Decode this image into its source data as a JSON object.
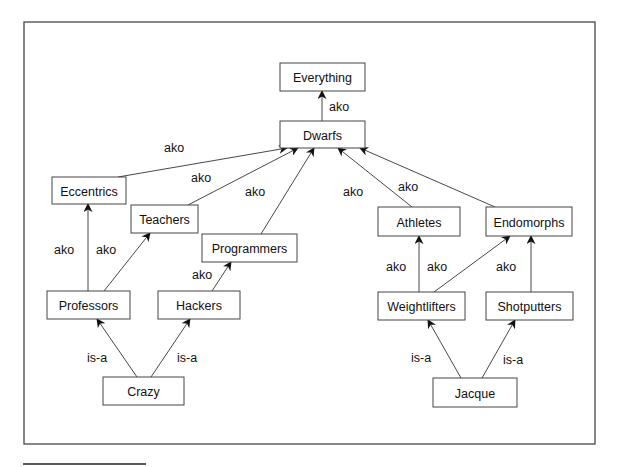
{
  "figure": {
    "frame": {
      "x": 24,
      "y": 22,
      "w": 571,
      "h": 422
    },
    "footnote_rule": {
      "x1": 23,
      "x2": 146,
      "y": 464
    },
    "nodes": [
      {
        "id": "everything",
        "label": "Everything",
        "x": 280,
        "y": 63,
        "w": 85,
        "h": 28
      },
      {
        "id": "dwarfs",
        "label": "Dwarfs",
        "x": 280,
        "y": 121,
        "w": 85,
        "h": 27
      },
      {
        "id": "eccentrics",
        "label": "Eccentrics",
        "x": 52,
        "y": 177,
        "w": 74,
        "h": 27
      },
      {
        "id": "teachers",
        "label": "Teachers",
        "x": 131,
        "y": 205,
        "w": 67,
        "h": 28
      },
      {
        "id": "programmers",
        "label": "Programmers",
        "x": 202,
        "y": 234,
        "w": 95,
        "h": 28
      },
      {
        "id": "athletes",
        "label": "Athletes",
        "x": 378,
        "y": 207,
        "w": 82,
        "h": 29
      },
      {
        "id": "endomorphs",
        "label": "Endomorphs",
        "x": 486,
        "y": 207,
        "w": 86,
        "h": 29
      },
      {
        "id": "professors",
        "label": "Professors",
        "x": 47,
        "y": 291,
        "w": 83,
        "h": 28
      },
      {
        "id": "hackers",
        "label": "Hackers",
        "x": 158,
        "y": 291,
        "w": 82,
        "h": 28
      },
      {
        "id": "weightlifters",
        "label": "Weightlifters",
        "x": 378,
        "y": 292,
        "w": 87,
        "h": 28
      },
      {
        "id": "shotputters",
        "label": "Shotputters",
        "x": 486,
        "y": 292,
        "w": 87,
        "h": 28
      },
      {
        "id": "crazy",
        "label": "Crazy",
        "x": 103,
        "y": 377,
        "w": 81,
        "h": 28
      },
      {
        "id": "jacque",
        "label": "Jacque",
        "x": 433,
        "y": 378,
        "w": 84,
        "h": 29
      }
    ],
    "edges": [
      {
        "from": "dwarfs",
        "to": "everything",
        "label": "ako",
        "x1": 322,
        "y1": 121,
        "x2": 322,
        "y2": 91,
        "lx": 329,
        "ly": 111
      },
      {
        "from": "eccentrics",
        "to": "dwarfs",
        "label": "ako",
        "x1": 118,
        "y1": 177,
        "x2": 287,
        "y2": 148,
        "lx": 164,
        "ly": 152
      },
      {
        "from": "teachers",
        "to": "dwarfs",
        "label": "ako",
        "x1": 188,
        "y1": 205,
        "x2": 298,
        "y2": 148,
        "lx": 191,
        "ly": 182
      },
      {
        "from": "programmers",
        "to": "dwarfs",
        "label": "ako",
        "x1": 261,
        "y1": 234,
        "x2": 314,
        "y2": 148,
        "lx": 245,
        "ly": 196
      },
      {
        "from": "athletes",
        "to": "dwarfs",
        "label": "ako",
        "x1": 412,
        "y1": 207,
        "x2": 338,
        "y2": 148,
        "lx": 343,
        "ly": 196
      },
      {
        "from": "endomorphs",
        "to": "dwarfs",
        "label": "ako",
        "x1": 495,
        "y1": 207,
        "x2": 360,
        "y2": 148,
        "lx": 398,
        "ly": 191
      },
      {
        "from": "professors",
        "to": "eccentrics",
        "label": "ako",
        "x1": 88,
        "y1": 291,
        "x2": 88,
        "y2": 204,
        "lx": 54,
        "ly": 254
      },
      {
        "from": "professors",
        "to": "teachers",
        "label": "ako",
        "x1": 104,
        "y1": 291,
        "x2": 150,
        "y2": 233,
        "lx": 96,
        "ly": 254
      },
      {
        "from": "hackers",
        "to": "programmers",
        "label": "ako",
        "x1": 212,
        "y1": 291,
        "x2": 231,
        "y2": 262,
        "lx": 192,
        "ly": 279
      },
      {
        "from": "weightlifters",
        "to": "athletes",
        "label": "ako",
        "x1": 419,
        "y1": 292,
        "x2": 419,
        "y2": 236,
        "lx": 386,
        "ly": 271
      },
      {
        "from": "weightlifters",
        "to": "endomorphs",
        "label": "ako",
        "x1": 434,
        "y1": 292,
        "x2": 510,
        "y2": 236,
        "lx": 427,
        "ly": 271
      },
      {
        "from": "shotputters",
        "to": "endomorphs",
        "label": "ako",
        "x1": 531,
        "y1": 292,
        "x2": 531,
        "y2": 236,
        "lx": 496,
        "ly": 271
      },
      {
        "from": "crazy",
        "to": "professors",
        "label": "is-a",
        "x1": 137,
        "y1": 377,
        "x2": 97,
        "y2": 319,
        "lx": 87,
        "ly": 362
      },
      {
        "from": "crazy",
        "to": "hackers",
        "label": "is-a",
        "x1": 151,
        "y1": 377,
        "x2": 190,
        "y2": 319,
        "lx": 177,
        "ly": 362
      },
      {
        "from": "jacque",
        "to": "weightlifters",
        "label": "is-a",
        "x1": 461,
        "y1": 378,
        "x2": 428,
        "y2": 320,
        "lx": 411,
        "ly": 362
      },
      {
        "from": "jacque",
        "to": "shotputters",
        "label": "is-a",
        "x1": 482,
        "y1": 378,
        "x2": 515,
        "y2": 320,
        "lx": 503,
        "ly": 364
      }
    ],
    "colors": {
      "stroke": "#333333",
      "frame": "#555555",
      "text": "#111111",
      "background": "#ffffff"
    }
  }
}
